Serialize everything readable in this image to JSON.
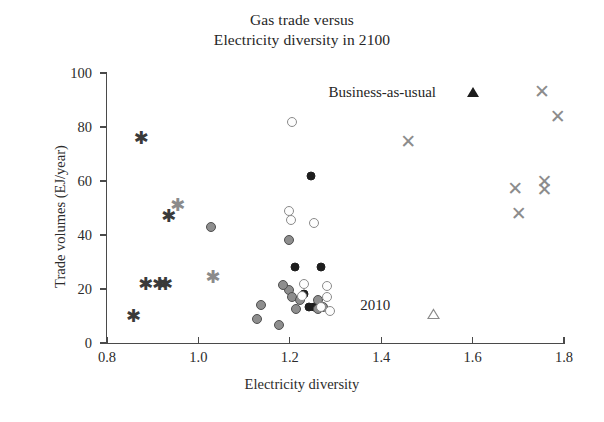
{
  "chart_data": {
    "type": "scatter",
    "title": "Gas trade versus Electricity diversity in 2100",
    "title_lines": [
      "Gas trade versus",
      "Electricity diversity in 2100"
    ],
    "xlabel": "Electricity diversity",
    "ylabel": "Trade volumes (EJ/year)",
    "xlim": [
      0.8,
      1.8
    ],
    "ylim": [
      0,
      100
    ],
    "xticks": [
      0.8,
      1.0,
      1.2,
      1.4,
      1.6,
      1.8
    ],
    "xtick_labels": [
      "0.8",
      "1.0",
      "1.2",
      "1.4",
      "1.6",
      "1.8"
    ],
    "yticks": [
      0,
      20,
      40,
      60,
      80,
      100
    ],
    "ytick_labels": [
      "0",
      "20",
      "40",
      "60",
      "80",
      "100"
    ],
    "grid": false,
    "legend": "none",
    "annotations": [
      {
        "text": "Business-as-usual",
        "x": 1.52,
        "y": 93,
        "marker": "filled-triangle",
        "marker_x": 1.6,
        "marker_y": 93
      },
      {
        "text": "2010",
        "x": 1.42,
        "y": 14,
        "marker": "open-triangle",
        "marker_x": 1.5,
        "marker_y": 13
      }
    ],
    "series": [
      {
        "name": "asterisk-dark",
        "marker": "asterisk",
        "color": "#3a3a3a",
        "points": [
          {
            "x": 0.875,
            "y": 76
          },
          {
            "x": 0.935,
            "y": 47
          },
          {
            "x": 0.885,
            "y": 22
          },
          {
            "x": 0.915,
            "y": 22
          },
          {
            "x": 0.928,
            "y": 22
          },
          {
            "x": 0.858,
            "y": 10
          }
        ]
      },
      {
        "name": "asterisk-light",
        "marker": "asterisk",
        "color": "#8b8b8b",
        "points": [
          {
            "x": 0.955,
            "y": 51
          },
          {
            "x": 1.032,
            "y": 24.5
          }
        ]
      },
      {
        "name": "circles-dark",
        "marker": "filled-circle",
        "color": "#1e1e1e",
        "points": [
          {
            "x": 1.247,
            "y": 62
          },
          {
            "x": 1.212,
            "y": 28
          },
          {
            "x": 1.268,
            "y": 28
          },
          {
            "x": 1.232,
            "y": 18
          },
          {
            "x": 1.242,
            "y": 13.5
          },
          {
            "x": 1.252,
            "y": 13.5
          }
        ]
      },
      {
        "name": "circles-mid",
        "marker": "shaded-circle",
        "color": "#8e8e8e",
        "points": [
          {
            "x": 1.028,
            "y": 43
          },
          {
            "x": 1.198,
            "y": 38
          },
          {
            "x": 1.137,
            "y": 14
          },
          {
            "x": 1.198,
            "y": 19.5
          },
          {
            "x": 1.205,
            "y": 17
          },
          {
            "x": 1.222,
            "y": 16
          },
          {
            "x": 1.186,
            "y": 21.5
          },
          {
            "x": 1.262,
            "y": 16
          },
          {
            "x": 1.261,
            "y": 12.5
          },
          {
            "x": 1.272,
            "y": 13.5
          },
          {
            "x": 1.128,
            "y": 9
          },
          {
            "x": 1.176,
            "y": 6.5
          },
          {
            "x": 1.213,
            "y": 12.5
          }
        ]
      },
      {
        "name": "circles-light",
        "marker": "open-circle",
        "color": "#fdfdfd",
        "points": [
          {
            "x": 1.205,
            "y": 82
          },
          {
            "x": 1.198,
            "y": 49
          },
          {
            "x": 1.203,
            "y": 45.5
          },
          {
            "x": 1.252,
            "y": 44.5
          },
          {
            "x": 1.232,
            "y": 22
          },
          {
            "x": 1.281,
            "y": 21
          },
          {
            "x": 1.281,
            "y": 17
          },
          {
            "x": 1.268,
            "y": 13.5
          },
          {
            "x": 1.289,
            "y": 12
          },
          {
            "x": 1.226,
            "y": 17.5
          }
        ]
      },
      {
        "name": "crosses",
        "marker": "cross",
        "color": "#8c8c8c",
        "points": [
          {
            "x": 1.459,
            "y": 75
          },
          {
            "x": 1.752,
            "y": 93.5
          },
          {
            "x": 1.786,
            "y": 84
          },
          {
            "x": 1.693,
            "y": 57.5
          },
          {
            "x": 1.757,
            "y": 60
          },
          {
            "x": 1.757,
            "y": 57
          },
          {
            "x": 1.701,
            "y": 48
          }
        ]
      }
    ]
  }
}
